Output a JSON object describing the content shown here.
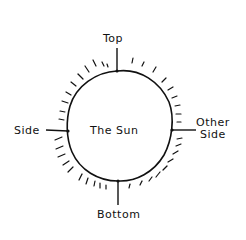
{
  "diagram": {
    "title": "The Sun",
    "center_label": "The Sun",
    "labels": {
      "top": "Top",
      "side": "Side",
      "other_side_line1": "Other",
      "other_side_line2": "Side",
      "bottom": "Bottom"
    },
    "style": {
      "stroke_color": "#111111",
      "background": "#ffffff"
    }
  }
}
